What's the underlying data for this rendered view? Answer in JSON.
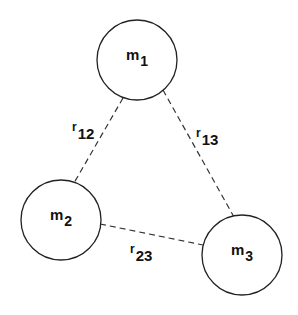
{
  "diagram": {
    "title": "",
    "nodes": [
      {
        "id": "m1",
        "label": "m",
        "subscript": "1",
        "cx": 137,
        "cy": 60,
        "r": 40
      },
      {
        "id": "m2",
        "label": "m",
        "subscript": "2",
        "cx": 61,
        "cy": 220,
        "r": 40
      },
      {
        "id": "m3",
        "label": "m",
        "subscript": "3",
        "cx": 242,
        "cy": 255,
        "r": 40
      }
    ],
    "edges": [
      {
        "id": "r12",
        "from": "m1",
        "to": "m2",
        "label": "r",
        "subscript": "12",
        "style": "dashed"
      },
      {
        "id": "r13",
        "from": "m1",
        "to": "m3",
        "label": "r",
        "subscript": "13",
        "style": "dashed"
      },
      {
        "id": "r23",
        "from": "m2",
        "to": "m3",
        "label": "r",
        "subscript": "23",
        "style": "dashed"
      }
    ],
    "colors": {
      "stroke": "#222222",
      "background": "#ffffff",
      "text": "#111111"
    }
  }
}
